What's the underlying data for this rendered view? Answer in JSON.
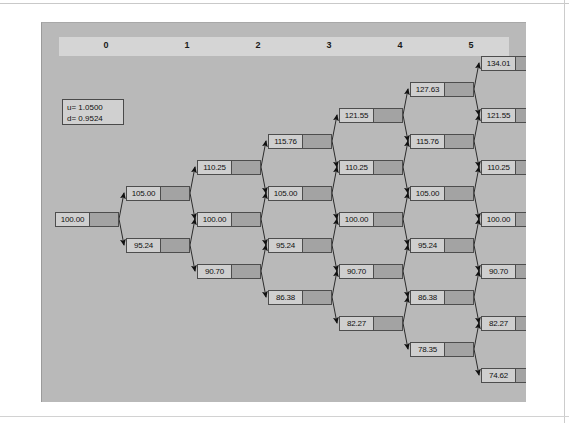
{
  "figure": {
    "type": "binomial-tree",
    "steps": 6,
    "legend": {
      "up_factor_label": "u= 1.0500",
      "down_factor_label": "d= 0.9524",
      "u": 1.05,
      "d": 0.9524
    },
    "step_headers": [
      "0",
      "1",
      "2",
      "3",
      "4",
      "5",
      "6"
    ],
    "columns": [
      {
        "step": "0",
        "nodes": [
          "100.00"
        ]
      },
      {
        "step": "1",
        "nodes": [
          "105.00",
          "95.24"
        ]
      },
      {
        "step": "2",
        "nodes": [
          "110.25",
          "100.00",
          "90.70"
        ]
      },
      {
        "step": "3",
        "nodes": [
          "115.76",
          "105.00",
          "95.24",
          "86.38"
        ]
      },
      {
        "step": "4",
        "nodes": [
          "121.55",
          "110.25",
          "100.00",
          "90.70",
          "82.27"
        ]
      },
      {
        "step": "5",
        "nodes": [
          "127.63",
          "115.76",
          "105.00",
          "95.24",
          "86.38",
          "78.35"
        ]
      },
      {
        "step": "6",
        "nodes": [
          "134.01",
          "121.55",
          "110.25",
          "100.00",
          "90.70",
          "82.27",
          "74.62"
        ]
      }
    ]
  },
  "chart_data": {
    "type": "diagram",
    "title": "",
    "subtype": "binomial-lattice",
    "parameters": {
      "u": 1.05,
      "d": 0.9524,
      "S0": 100.0,
      "steps": 6
    },
    "x": [
      0,
      1,
      2,
      3,
      4,
      5,
      6
    ],
    "levels": [
      [
        100.0
      ],
      [
        105.0,
        95.24
      ],
      [
        110.25,
        100.0,
        90.7
      ],
      [
        115.76,
        105.0,
        95.24,
        86.38
      ],
      [
        121.55,
        110.25,
        100.0,
        90.7,
        82.27
      ],
      [
        127.63,
        115.76,
        105.0,
        95.24,
        86.38,
        78.35
      ],
      [
        134.01,
        121.55,
        110.25,
        100.0,
        90.7,
        82.27,
        74.62
      ]
    ]
  },
  "colors": {
    "canvas": "#b9b9b9",
    "header_strip": "#d5d5d5",
    "node_value_cell": "#cfcfcf",
    "node_payoff_cell": "#a3a3a3",
    "node_border": "#4d4d4d",
    "page": "#ffffff"
  }
}
